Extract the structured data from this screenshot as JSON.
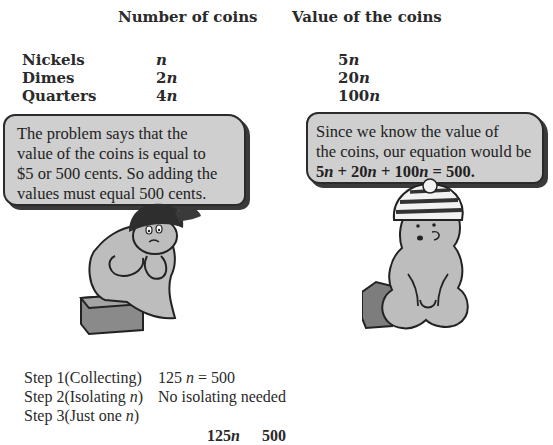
{
  "table": {
    "headers": [
      "Number of coins",
      "Value of the coins"
    ],
    "rows": [
      {
        "label": "Nickels",
        "count_coef": "",
        "count_var": "n",
        "value_coef": "5",
        "value_var": "n"
      },
      {
        "label": "Dimes",
        "count_coef": "2",
        "count_var": "n",
        "value_coef": "20",
        "value_var": "n"
      },
      {
        "label": "Quarters",
        "count_coef": "4",
        "count_var": "n",
        "value_coef": "100",
        "value_var": "n"
      }
    ]
  },
  "left_bubble": {
    "lines": [
      "The problem says that the",
      "value of the coins is equal to",
      "$5 or 500 cents. So adding the",
      "values must equal 500 cents."
    ]
  },
  "right_bubble": {
    "lines": [
      "Since we know the value of",
      "the coins, our equation would be"
    ],
    "equation": {
      "t1": "5",
      "t2": " + 20",
      "t3": " + 100",
      "t4": " = 500.",
      "var": "n"
    }
  },
  "characters": [
    {
      "name": "thinking-character",
      "accessory": "cap",
      "seat": "box"
    },
    {
      "name": "explaining-character",
      "accessory": "striped-beanie",
      "seat": "box"
    }
  ],
  "steps": [
    {
      "label_a": "Step 1(Collecting)",
      "label_var": "",
      "label_b": "",
      "result_a": "125 ",
      "result_var": "n",
      "result_b": " = 500"
    },
    {
      "label_a": "Step 2(Isolating ",
      "label_var": "n",
      "label_b": ")",
      "result_a": "No isolating needed",
      "result_var": "",
      "result_b": ""
    },
    {
      "label_a": "Step 3(Just one ",
      "label_var": "n",
      "label_b": ")",
      "result_a": "",
      "result_var": "",
      "result_b": ""
    }
  ],
  "division": {
    "left_coef": "125",
    "left_var": "n",
    "right": "500"
  },
  "colors": {
    "text": "#2a2a2a",
    "bubble_fill": "#cfcfcf",
    "bubble_border": "#2b2b2b",
    "character_fill": "#bdbdbd"
  }
}
